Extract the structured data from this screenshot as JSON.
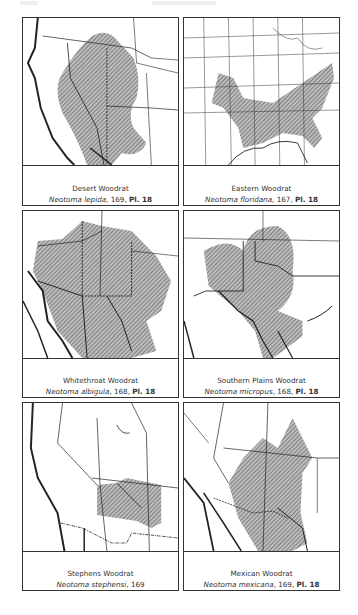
{
  "page": {
    "header": {
      "left": "",
      "center": ""
    },
    "hatch_color": "#555555",
    "line_color": "#222222"
  },
  "panels": [
    {
      "id": "desert",
      "common_name": "Desert Woodrat",
      "scientific_name": "Neotoma lepida",
      "page_ref": ", 169, ",
      "plate": "Pl. 18"
    },
    {
      "id": "eastern",
      "common_name": "Eastern Woodrat",
      "scientific_name": "Neotoma floridana",
      "page_ref": ", 167, ",
      "plate": "Pl. 18"
    },
    {
      "id": "whitethroat",
      "common_name": "Whitethroat Woodrat",
      "scientific_name": "Neotoma albigula",
      "page_ref": ", 168, ",
      "plate": "Pl. 18"
    },
    {
      "id": "southern-plains",
      "common_name": "Southern Plains Woodrat",
      "scientific_name": "Neotoma micropus",
      "page_ref": ", 168, ",
      "plate": "Pl. 18"
    },
    {
      "id": "stephens",
      "common_name": "Stephens Woodrat",
      "scientific_name": "Neotoma stephensi",
      "page_ref": ", 169",
      "plate": ""
    },
    {
      "id": "mexican",
      "common_name": "Mexican Woodrat",
      "scientific_name": "Neotoma mexicana",
      "page_ref": ", 169, ",
      "plate": "Pl. 18"
    }
  ]
}
